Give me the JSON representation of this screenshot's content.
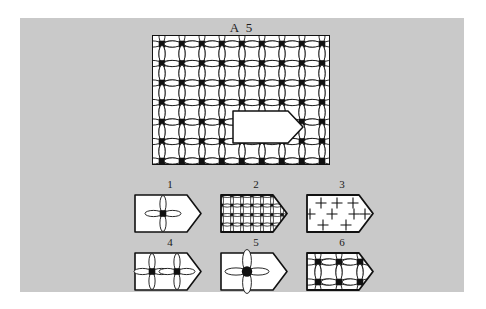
{
  "page": {
    "background_color": "#ffffff",
    "panel_color": "#c9c9c9",
    "ink_color": "#111111",
    "paper_color": "#ffffff"
  },
  "header": {
    "title": "A 5"
  },
  "stimulus": {
    "name": "main-pattern-rectangle",
    "description": "Large rectangle filled with a repeating lattice motif and a white pentagon cut-out",
    "motif": "black-square-with-four-white-petals",
    "grid_columns": 9,
    "grid_rows": 7,
    "cutout_shape": "pentagon-home-plate",
    "cutout_fill": "#ffffff"
  },
  "options": [
    {
      "number": "1",
      "name": "option-1",
      "pattern": "single-centered-motif",
      "motif_count": 1,
      "scale": "large"
    },
    {
      "number": "2",
      "name": "option-2",
      "pattern": "dense-fine-grid",
      "motif_count": 20,
      "scale": "small"
    },
    {
      "number": "3",
      "name": "option-3",
      "pattern": "plus-signs-only",
      "motif_count": 8,
      "scale": "medium"
    },
    {
      "number": "4",
      "name": "option-4",
      "pattern": "two-motifs-horizontal",
      "motif_count": 2,
      "scale": "medium"
    },
    {
      "number": "5",
      "name": "option-5",
      "pattern": "single-large-motif-round-center",
      "motif_count": 1,
      "scale": "extra-large"
    },
    {
      "number": "6",
      "name": "option-6",
      "pattern": "three-by-two-lattice",
      "motif_count": 6,
      "scale": "matching"
    }
  ]
}
